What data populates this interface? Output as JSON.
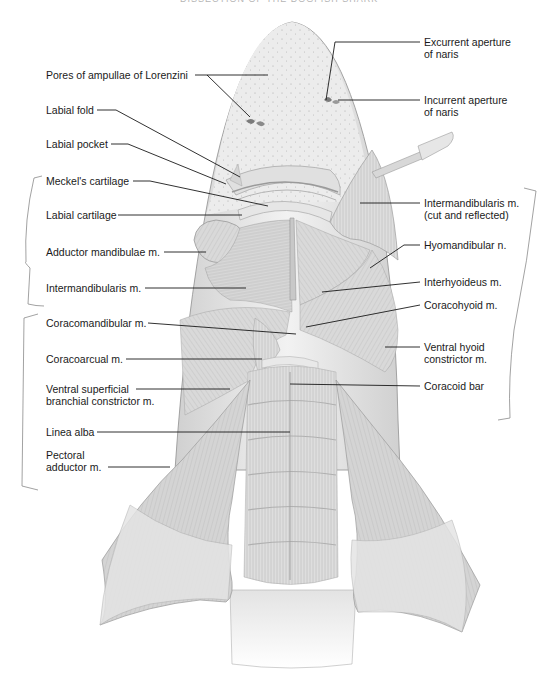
{
  "figure": {
    "header_cut_text": "DISSECTION OF THE DOGFISH SHARK",
    "colors": {
      "background": "#ffffff",
      "skin": "#ececec",
      "muscle": "#d6d6d6",
      "muscle_dark": "#bdbdbd",
      "outline": "#9a9a9a",
      "leader_line": "#1a1a1a",
      "bracket": "#8a8a8a",
      "text": "#1a1a1a"
    }
  },
  "labels_left": [
    {
      "id": "pores-ampullae",
      "text": [
        "Pores of ampullae of Lorenzini"
      ]
    },
    {
      "id": "labial-fold",
      "text": [
        "Labial fold"
      ]
    },
    {
      "id": "labial-pocket",
      "text": [
        "Labial pocket"
      ]
    },
    {
      "id": "meckels-cartilage",
      "text": [
        "Meckel's cartilage"
      ]
    },
    {
      "id": "labial-cartilage",
      "text": [
        "Labial cartilage"
      ]
    },
    {
      "id": "adductor-mandibulae",
      "text": [
        "Adductor mandibulae m."
      ]
    },
    {
      "id": "intermandibularis",
      "text": [
        "Intermandibularis m."
      ]
    },
    {
      "id": "coracomandibular",
      "text": [
        "Coracomandibular m."
      ]
    },
    {
      "id": "coracoarcual",
      "text": [
        "Coracoarcual m."
      ]
    },
    {
      "id": "ventral-superficial-branchial-constrictor",
      "text": [
        "Ventral superficial",
        "branchial constrictor m."
      ]
    },
    {
      "id": "linea-alba",
      "text": [
        "Linea alba"
      ]
    },
    {
      "id": "pectoral-adductor",
      "text": [
        "Pectoral",
        "adductor m."
      ]
    }
  ],
  "labels_right": [
    {
      "id": "excurrent-aperture",
      "text": [
        "Excurrent aperture",
        "of naris"
      ]
    },
    {
      "id": "incurrent-aperture",
      "text": [
        "Incurrent aperture",
        "of naris"
      ]
    },
    {
      "id": "intermandibularis-reflected",
      "text": [
        "Intermandibularis m.",
        "(cut and reflected)"
      ]
    },
    {
      "id": "hyomandibular-nerve",
      "text": [
        "Hyomandibular n."
      ]
    },
    {
      "id": "interhyoideus",
      "text": [
        "Interhyoideus m."
      ]
    },
    {
      "id": "coracohyoid",
      "text": [
        "Coracohyoid m."
      ]
    },
    {
      "id": "ventral-hyoid-constrictor",
      "text": [
        "Ventral hyoid",
        "constrictor m."
      ]
    },
    {
      "id": "coracoid-bar",
      "text": [
        "Coracoid bar"
      ]
    }
  ]
}
